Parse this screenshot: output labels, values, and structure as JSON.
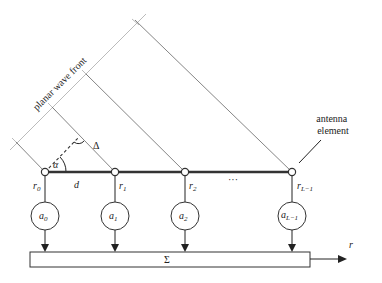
{
  "diagram": {
    "type": "antenna-array-beamforming",
    "labels": {
      "wavefront": "planar wave front",
      "antenna_line1": "antenna",
      "antenna_line2": "element",
      "alpha": "α",
      "delta": "Δ",
      "spacing": "d",
      "ellipsis": "···",
      "sum": "Σ",
      "output": "r"
    },
    "elements": [
      {
        "id": "r0",
        "pos_label": "r",
        "pos_sub": "0",
        "weight_label": "a",
        "weight_sub": "0"
      },
      {
        "id": "r1",
        "pos_label": "r",
        "pos_sub": "1",
        "weight_label": "a",
        "weight_sub": "1"
      },
      {
        "id": "r2",
        "pos_label": "r",
        "pos_sub": "2",
        "weight_label": "a",
        "weight_sub": "2"
      },
      {
        "id": "rL-1",
        "pos_label": "r",
        "pos_sub": "L−1",
        "weight_label": "a",
        "weight_sub": "L−1"
      }
    ],
    "colors": {
      "line": "#333333",
      "wavefront": "#aaaaaa",
      "ray": "#777777",
      "background": "#ffffff"
    }
  }
}
